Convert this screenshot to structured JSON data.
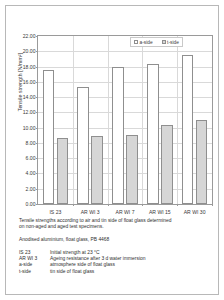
{
  "chart_data": {
    "type": "bar",
    "title": "",
    "xlabel": "",
    "ylabel": "Tensile strength   [N/mm²]",
    "ylim": [
      0,
      22
    ],
    "ytick_step": 2,
    "grid": true,
    "legend_position": "top-right",
    "categories": [
      "IS 23",
      "AR WI 3",
      "AR WI 7",
      "AR WI 15",
      "AR WI 30"
    ],
    "yticks": [
      "0.00",
      "2.00",
      "4.00",
      "6.00",
      "8.00",
      "10.00",
      "12.00",
      "14.00",
      "16.00",
      "18.00",
      "20.00",
      "22.00"
    ],
    "series": [
      {
        "name": "a-side",
        "fill": "#ffffff",
        "values": [
          17.5,
          15.3,
          18.0,
          18.4,
          19.5
        ]
      },
      {
        "name": "t-side",
        "fill": "#d6d6d6",
        "values": [
          8.7,
          8.9,
          9.0,
          10.3,
          11.0
        ]
      }
    ]
  },
  "legend": {
    "entries": [
      {
        "label": "a-side",
        "icon": "square-swatch-white"
      },
      {
        "label": "t-side",
        "icon": "square-swatch-gray"
      }
    ]
  },
  "caption": {
    "line1": "Tensile strengths according to air and tin side of float glass determined",
    "line2": "on non-aged and aged test specimens.",
    "material": "Anodised aluminium, float glass, PB 4468",
    "definitions": [
      {
        "key": "IS 23",
        "value": "Initial strength at 23 °C"
      },
      {
        "key": "AR WI 3",
        "value": "Ageing resistance after 3 d water immersion"
      },
      {
        "key": "a-side",
        "value": "atmosphere side of float glass"
      },
      {
        "key": "t-side",
        "value": "tin side of float glass"
      }
    ]
  },
  "colors": {
    "frame": "#b8b8b8",
    "axis": "#9a9a9a",
    "grid": "#d9d9d9",
    "bar_a": "#ffffff",
    "bar_t": "#d6d6d6",
    "bar_edge": "#8f8f8f",
    "text": "#2f2f2f"
  }
}
